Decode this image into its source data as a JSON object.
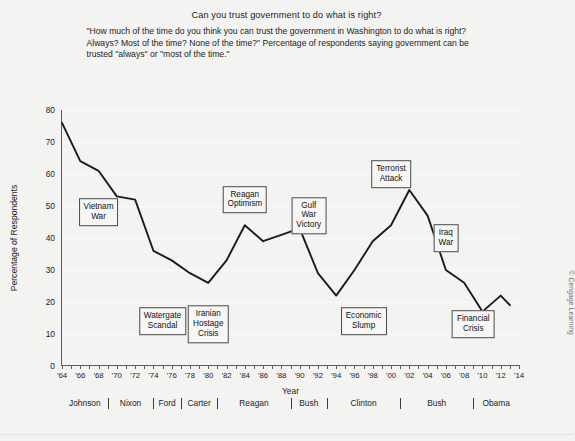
{
  "chart_data": {
    "type": "line",
    "title": "Can you trust government to do what is right?",
    "subtitle": "\"How much of the time do you think you can trust the government in Washington to do what is right? Always? Most of the time? None of the time?\" Percentage of respondents saying government can be trusted \"always\" or \"most of the time.\"",
    "xlabel": "Year",
    "ylabel": "Percentage of Respondents",
    "xlim": [
      1964,
      2014
    ],
    "ylim": [
      0,
      80
    ],
    "ytick_step": 10,
    "xtick_step": 2,
    "grid": true,
    "legend": "none",
    "line_color": "#1b1b1b",
    "yticks": [
      0,
      10,
      20,
      30,
      40,
      50,
      60,
      70,
      80
    ],
    "xticks": [
      "'64",
      "'66",
      "'68",
      "'70",
      "'72",
      "'74",
      "'76",
      "'78",
      "'80",
      "'82",
      "'84",
      "'86",
      "'88",
      "'90",
      "'92",
      "'94",
      "'96",
      "'98",
      "'00",
      "'02",
      "'04",
      "'06",
      "'08",
      "'10",
      "'12",
      "'14"
    ],
    "x": [
      1964,
      1966,
      1968,
      1970,
      1972,
      1974,
      1976,
      1978,
      1980,
      1982,
      1984,
      1986,
      1988,
      1990,
      1992,
      1994,
      1996,
      1998,
      2000,
      2002,
      2004,
      2006,
      2008,
      2010,
      2012,
      2013
    ],
    "values": [
      76,
      64,
      61,
      53,
      52,
      36,
      33,
      29,
      26,
      33,
      44,
      39,
      41,
      43,
      29,
      22,
      30,
      39,
      44,
      55,
      47,
      30,
      26,
      17,
      22,
      19
    ],
    "series": [
      {
        "name": "Trust in government",
        "values": [
          76,
          64,
          61,
          53,
          52,
          36,
          33,
          29,
          26,
          33,
          44,
          39,
          41,
          43,
          29,
          22,
          30,
          39,
          44,
          55,
          47,
          30,
          26,
          17,
          22,
          19
        ]
      }
    ],
    "annotations": [
      {
        "label": "Vietnam\nWar",
        "x_year": 1968,
        "y_value": 48
      },
      {
        "label": "Watergate\nScandal",
        "x_year": 1975,
        "y_value": 14
      },
      {
        "label": "Iranian\nHostage\nCrisis",
        "x_year": 1980,
        "y_value": 13
      },
      {
        "label": "Reagan\nOptimism",
        "x_year": 1984,
        "y_value": 52
      },
      {
        "label": "Gulf\nWar\nVictory",
        "x_year": 1991,
        "y_value": 47
      },
      {
        "label": "Terrorist\nAttack",
        "x_year": 2000,
        "y_value": 60
      },
      {
        "label": "Economic\nSlump",
        "x_year": 1997,
        "y_value": 14
      },
      {
        "label": "Iraq\nWar",
        "x_year": 2006,
        "y_value": 40
      },
      {
        "label": "Financial\nCrisis",
        "x_year": 2009,
        "y_value": 13
      }
    ],
    "presidents": [
      {
        "name": "Johnson",
        "start": 1964,
        "end": 1969
      },
      {
        "name": "Nixon",
        "start": 1969,
        "end": 1974
      },
      {
        "name": "Ford",
        "start": 1974,
        "end": 1977
      },
      {
        "name": "Carter",
        "start": 1977,
        "end": 1981
      },
      {
        "name": "Reagan",
        "start": 1981,
        "end": 1989
      },
      {
        "name": "Bush",
        "start": 1989,
        "end": 1993
      },
      {
        "name": "Clinton",
        "start": 1993,
        "end": 2001
      },
      {
        "name": "Bush",
        "start": 2001,
        "end": 2009
      },
      {
        "name": "Obama",
        "start": 2009,
        "end": 2014
      }
    ]
  },
  "credit": "© Cengage Learning"
}
